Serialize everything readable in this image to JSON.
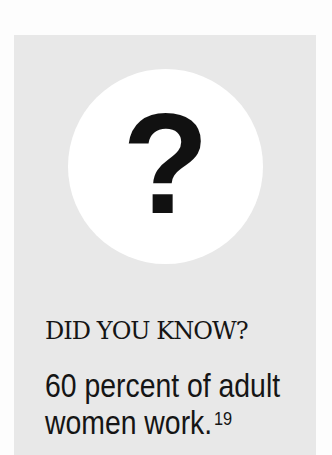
{
  "callout": {
    "icon": "question-mark-icon",
    "icon_glyph": "?",
    "heading": "DID YOU KNOW?",
    "body_line1": "60 percent of adult",
    "body_line2": "women work.",
    "footnote": "19"
  },
  "colors": {
    "panel_bg": "#e8e8e8",
    "circle_bg": "#ffffff",
    "text": "#151515"
  }
}
